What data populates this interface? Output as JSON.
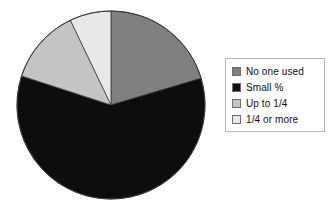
{
  "chart_data": {
    "type": "pie",
    "title": "",
    "xlabel": "",
    "ylabel": "",
    "legend_position": "right",
    "grid": false,
    "categories": [
      "No one used",
      "Small %",
      "Up to 1/4",
      "1/4 or more"
    ],
    "values": [
      20.4,
      59.6,
      12.9,
      7.1
    ],
    "colors": [
      "#808080",
      "#0d0d0d",
      "#c4c4c4",
      "#e8e8e8"
    ],
    "slices": [
      {
        "label": "No one used",
        "value": 20.4,
        "color": "#808080",
        "start_angle": 0.0,
        "end_angle": 73.5
      },
      {
        "label": "Small %",
        "value": 59.6,
        "color": "#0d0d0d",
        "start_angle": 73.5,
        "end_angle": 288.0
      },
      {
        "label": "Up to 1/4",
        "value": 12.9,
        "color": "#c4c4c4",
        "start_angle": 288.0,
        "end_angle": 334.4
      },
      {
        "label": "1/4 or more",
        "value": 7.1,
        "color": "#e8e8e8",
        "start_angle": 334.4,
        "end_angle": 360.0
      }
    ]
  },
  "legend": {
    "items": [
      {
        "label": "No one used",
        "swatch": "#808080"
      },
      {
        "label": "Small %",
        "swatch": "#0d0d0d"
      },
      {
        "label": "Up to 1/4",
        "swatch": "#c4c4c4"
      },
      {
        "label": "1/4 or more",
        "swatch": "#e8e8e8"
      }
    ]
  },
  "figure": {
    "background": "#ffffff",
    "outline_color": "#3a3a3a",
    "legend_border": "#b7b7b7"
  }
}
